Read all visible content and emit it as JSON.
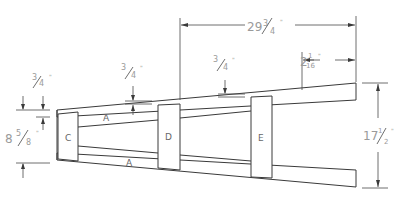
{
  "drawing": {
    "title": "Tapered frame assembly",
    "parts": [
      {
        "id": "rail-top",
        "label": "A"
      },
      {
        "id": "rail-bottom",
        "label": "A"
      },
      {
        "id": "block-c",
        "label": "C"
      },
      {
        "id": "block-d",
        "label": "D"
      },
      {
        "id": "block-e",
        "label": "E"
      }
    ],
    "dimensions": {
      "overall_length": {
        "whole": "29",
        "num": "3",
        "den": "4",
        "unit": "\""
      },
      "end_offset": {
        "whole": "2",
        "num": "1",
        "den": "16",
        "unit": "\""
      },
      "rail_thickness_left": {
        "whole": "",
        "num": "3",
        "den": "4",
        "unit": "\""
      },
      "rail_thickness_mid": {
        "whole": "",
        "num": "3",
        "den": "4",
        "unit": "\""
      },
      "rail_thickness_right": {
        "whole": "",
        "num": "3",
        "den": "4",
        "unit": "\""
      },
      "narrow_end_width": {
        "whole": "8",
        "num": "5",
        "den": "8",
        "unit": "\""
      },
      "wide_end_width": {
        "whole": "17",
        "num": "1",
        "den": "2",
        "unit": "\""
      }
    },
    "colors": {
      "line": "#3a3a3a",
      "dimension_text": "#9a9a9a",
      "background": "#ffffff"
    }
  }
}
